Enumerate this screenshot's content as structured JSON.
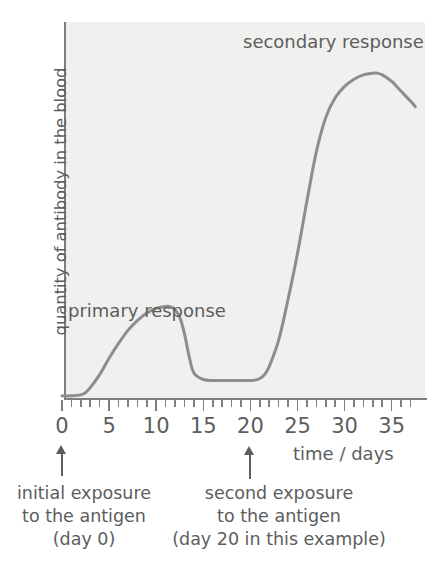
{
  "chart_data": {
    "type": "line",
    "title": "",
    "xlabel": "time / days",
    "ylabel": "quantity of antibody in the blood",
    "xlim": [
      0,
      37.5
    ],
    "ylim": [
      0,
      1
    ],
    "grid": false,
    "legend": "none",
    "x_ticks_major": [
      0,
      5,
      10,
      15,
      20,
      25,
      30,
      35
    ],
    "x_tick_labels": [
      "0",
      "5",
      "10",
      "15",
      "20",
      "25",
      "30",
      "35"
    ],
    "x_tick_interval_minor": 1,
    "y_ticks": [],
    "y_tick_labels": [],
    "series": [
      {
        "name": "antibody concentration",
        "color": "#8d8d8d",
        "x": [
          0,
          1,
          2,
          2.5,
          3,
          4,
          5,
          6,
          7,
          8,
          9,
          10,
          11,
          11.5,
          12,
          12.5,
          13,
          13.5,
          14,
          15,
          16,
          17,
          18,
          19,
          20,
          20.5,
          21,
          21.5,
          22,
          23,
          24,
          25,
          26,
          27,
          28,
          29,
          30,
          31,
          32,
          33,
          33.5,
          34,
          35,
          36,
          37,
          37.5
        ],
        "y": [
          0.005,
          0.005,
          0.008,
          0.015,
          0.03,
          0.07,
          0.12,
          0.165,
          0.205,
          0.235,
          0.258,
          0.272,
          0.278,
          0.277,
          0.268,
          0.245,
          0.195,
          0.125,
          0.075,
          0.055,
          0.052,
          0.052,
          0.052,
          0.052,
          0.052,
          0.053,
          0.058,
          0.07,
          0.095,
          0.175,
          0.3,
          0.44,
          0.6,
          0.75,
          0.855,
          0.915,
          0.95,
          0.972,
          0.985,
          0.99,
          0.99,
          0.985,
          0.965,
          0.935,
          0.905,
          0.888
        ]
      }
    ],
    "annotations": [
      {
        "text": "secondary response",
        "x": 18.9,
        "y": 0.94
      },
      {
        "text": "primary response",
        "x": 0.2,
        "y": 0.23
      }
    ]
  },
  "axes": {
    "y_title": "quantity of antibody in the blood",
    "x_title": "time / days",
    "x_tick_labels": [
      "0",
      "5",
      "10",
      "15",
      "20",
      "25",
      "30",
      "35"
    ]
  },
  "plot_labels": {
    "secondary_response": "secondary response",
    "primary_response": "primary response"
  },
  "captions": {
    "initial_exposure": {
      "line1": "initial exposure",
      "line2": "to the antigen",
      "line3": "(day 0)"
    },
    "second_exposure": {
      "line1": "second exposure",
      "line2": "to the antigen",
      "line3": "(day 20 in this example)"
    }
  },
  "colors": {
    "curve": "#8d8d8d",
    "axis": "#7e7e7e",
    "text": "#5d5d5d",
    "plot_background": "#f0f0ef",
    "page_background": "#ffffff"
  }
}
